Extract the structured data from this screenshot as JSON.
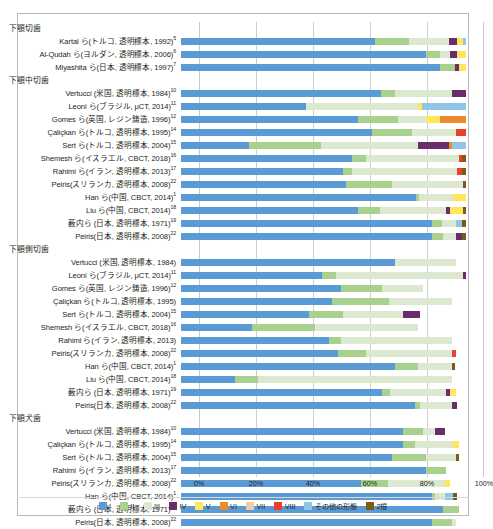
{
  "chart_data": {
    "type": "bar",
    "title": "",
    "xlabel": "",
    "ylabel": "",
    "stacked": "100%",
    "orientation": "horizontal",
    "xlim": [
      0,
      100
    ],
    "xticks": [
      "0%",
      "20%",
      "40%",
      "60%",
      "80%",
      "100%"
    ],
    "xtick_values": [
      0,
      20,
      40,
      60,
      80,
      100
    ],
    "grid": true,
    "legend_position": "bottom",
    "series": [
      {
        "name": "I",
        "color": "#5B9BD5"
      },
      {
        "name": "II",
        "color": "#A9D18E"
      },
      {
        "name": "III",
        "color": "#DCE9D0"
      },
      {
        "name": "IV",
        "color": "#6A2C6A"
      },
      {
        "name": "V",
        "color": "#FFE65A"
      },
      {
        "name": "VI",
        "color": "#ED8B2B"
      },
      {
        "name": "VII",
        "color": "#F7C9A6"
      },
      {
        "name": "VIII",
        "color": "#E8402A"
      },
      {
        "name": "その他の形態",
        "color": "#8FC6E8"
      },
      {
        "name": "2根",
        "color": "#7B5B18"
      }
    ],
    "sections": [
      {
        "header": "下顎切歯",
        "rows": [
          {
            "label": "Kartal ら(トルコ, 透明標本, 1992)",
            "ref": "5",
            "values": [
              68.0,
              12.0,
              14.0,
              3.0,
              2.0,
              0,
              0,
              0,
              1.0,
              0
            ]
          },
          {
            "label": "Al-Qudah ら(ヨルダン, 透明標本, 2006)",
            "ref": "6",
            "values": [
              86.0,
              5.0,
              3.5,
              2.5,
              3.0,
              0,
              0,
              0,
              0,
              0
            ]
          },
          {
            "label": "Miyashita ら(日本, 透明標本, 1997)",
            "ref": "7",
            "values": [
              91.0,
              5.0,
              0,
              1.5,
              2.5,
              0,
              0,
              0,
              0,
              0
            ]
          }
        ]
      },
      {
        "header": "下顎中切歯",
        "rows": [
          {
            "label": "Vertucci (米国, 透明標本, 1984)",
            "ref": "10",
            "values": [
              70.0,
              5.0,
              20.0,
              5.0,
              0,
              0,
              0,
              0,
              0,
              0
            ]
          },
          {
            "label": "Leoni ら(ブラジル, μCT, 2014)",
            "ref": "11",
            "values": [
              44.0,
              0,
              39.0,
              0,
              1.5,
              0,
              0,
              0,
              15.5,
              0
            ]
          },
          {
            "label": "Gomes ら(英国, レジン鋳造, 1996)",
            "ref": "12",
            "values": [
              62.0,
              14.0,
              10.0,
              0,
              5.0,
              9.0,
              0,
              0,
              0,
              0
            ]
          },
          {
            "label": "Çaliçkan ら(トルコ, 透明標本, 1995)",
            "ref": "14",
            "values": [
              67.0,
              14.0,
              15.5,
              0,
              0,
              0,
              0,
              3.5,
              0,
              0
            ]
          },
          {
            "label": "Sert ら(トルコ, 透明標本, 2004)",
            "ref": "15",
            "values": [
              24.0,
              25.0,
              34.0,
              11.0,
              0,
              1.0,
              0,
              0,
              5.0,
              0
            ]
          },
          {
            "label": "Shemesh ら(イスラエル, CBCT, 2018)",
            "ref": "16",
            "values": [
              60.0,
              5.0,
              32.5,
              0,
              0,
              0,
              0,
              1.0,
              0,
              1.5
            ]
          },
          {
            "label": "Rahimi ら(イラン, 透明標本, 2013)",
            "ref": "17",
            "values": [
              57.0,
              3.0,
              37.0,
              0,
              0,
              0,
              0,
              1.5,
              0,
              1.5
            ]
          },
          {
            "label": "Peiris(スリランカ, 透明標本, 2008)",
            "ref": "22",
            "values": [
              58.0,
              16.0,
              25.0,
              0,
              0,
              0,
              0,
              0,
              0,
              1.0
            ]
          },
          {
            "label": "Han ら(中国, CBCT, 2014)",
            "ref": "1",
            "values": [
              82.5,
              1.0,
              12.0,
              0,
              4.5,
              0,
              0,
              0,
              0,
              0
            ]
          },
          {
            "label": "Liu ら(中国, CBCT, 2014)",
            "ref": "18",
            "values": [
              62.0,
              8.0,
              23.0,
              1.5,
              4.5,
              0,
              0,
              0,
              0,
              1.0
            ]
          },
          {
            "label": "薮内ら (日本, 透明標本, 1971)",
            "ref": "19",
            "values": [
              88.0,
              3.5,
              5.0,
              0,
              0,
              0,
              0,
              0,
              2.0,
              1.5
            ]
          },
          {
            "label": "Peiris(日本, 透明標本, 2008)",
            "ref": "22",
            "values": [
              88.0,
              4.0,
              4.5,
              2.0,
              0,
              0,
              0,
              0,
              0,
              1.5
            ]
          }
        ]
      },
      {
        "header": "下顎側切歯",
        "rows": [
          {
            "label": "Vertucci (米国, 透明標本, 1984)",
            "ref": "",
            "values": [
              75.0,
              0,
              21.5,
              0,
              0,
              0,
              0,
              0,
              0,
              0
            ]
          },
          {
            "label": "Leoni ら(ブラジル, μCT, 2014)",
            "ref": "11",
            "values": [
              49.5,
              5.0,
              44.5,
              1.0,
              0,
              0,
              0,
              0,
              0,
              0
            ]
          },
          {
            "label": "Gomes ら(英国, レジン鋳造, 1996)",
            "ref": "12",
            "values": [
              56.0,
              14.5,
              14.5,
              0,
              0,
              0,
              0,
              0,
              0,
              0
            ]
          },
          {
            "label": "Çaliçkan ら(トルコ, 透明標本, 1995)",
            "ref": "",
            "values": [
              53.0,
              20.0,
              22.0,
              0,
              0,
              0,
              0,
              0,
              0,
              0
            ]
          },
          {
            "label": "Sert ら(トルコ, 透明標本, 2004)",
            "ref": "15",
            "values": [
              45.0,
              12.0,
              21.0,
              6.0,
              0,
              0,
              0,
              0,
              0,
              0
            ]
          },
          {
            "label": "Shemesh ら(イスラエル, CBCT, 2018)",
            "ref": "16",
            "values": [
              25.0,
              22.0,
              36.0,
              0,
              0,
              0,
              0,
              0,
              0,
              0
            ]
          },
          {
            "label": "Rahimi ら(イラン, 透明標本, 2013)",
            "ref": "",
            "values": [
              52.0,
              4.0,
              39.0,
              0,
              0,
              0,
              0,
              0,
              0,
              0
            ]
          },
          {
            "label": "Peiris(スリランカ, 透明標本, 2008)",
            "ref": "22",
            "values": [
              55.0,
              10.0,
              30.0,
              0,
              0,
              0,
              0,
              1.5,
              0,
              0
            ]
          },
          {
            "label": "Han ら(中国, CBCT, 2014)",
            "ref": "1",
            "values": [
              75.0,
              8.0,
              12.0,
              0,
              0,
              0,
              0,
              0,
              0,
              1.0
            ]
          },
          {
            "label": "Liu ら(中国, CBCT, 2014)",
            "ref": "18",
            "values": [
              19.0,
              8.0,
              68.0,
              0,
              0,
              0,
              0,
              0,
              0,
              0
            ]
          },
          {
            "label": "薮内ら (日本, 透明標本, 1971)",
            "ref": "19",
            "values": [
              70.5,
              3.0,
              19.5,
              1.5,
              2.0,
              0,
              0,
              0,
              0,
              0
            ]
          },
          {
            "label": "Peiris(日本, 透明標本, 2008)",
            "ref": "22",
            "values": [
              82.0,
              2.0,
              11.0,
              2.0,
              0,
              0,
              0,
              0,
              0,
              0
            ]
          }
        ]
      },
      {
        "header": "下顎犬歯",
        "rows": [
          {
            "label": "Vertucci (米国, 透明標本, 1984)",
            "ref": "10",
            "values": [
              78.0,
              7.0,
              4.0,
              3.5,
              0,
              0,
              0,
              0,
              0,
              0
            ]
          },
          {
            "label": "Çaliçkan ら(トルコ, 透明標本, 1995)",
            "ref": "14",
            "values": [
              78.0,
              4.0,
              13.5,
              0,
              2.0,
              0,
              0,
              0,
              0,
              0
            ]
          },
          {
            "label": "Sert ら(トルコ, 透明標本, 2004)",
            "ref": "15",
            "values": [
              74.0,
              12.0,
              10.5,
              0,
              0,
              0,
              0,
              0,
              0,
              1.0
            ]
          },
          {
            "label": "Rahimi ら(イラン, 透明標本, 2013)",
            "ref": "17",
            "values": [
              86.0,
              7.0,
              0,
              0,
              0,
              0,
              0,
              0,
              0,
              0
            ]
          },
          {
            "label": "Peiris(スリランカ, 透明標本, 2008)",
            "ref": "22",
            "values": [
              63.0,
              9.5,
              20.0,
              0,
              2.0,
              0,
              0,
              0,
              0,
              0
            ]
          },
          {
            "label": "Han ら(中国, CBCT, 2014)",
            "ref": "1",
            "values": [
              88.0,
              1.0,
              3.5,
              0,
              0,
              0,
              0,
              0,
              3.0,
              1.5
            ]
          },
          {
            "label": "薮内ら (日本, 透明標本, 1971)",
            "ref": "19",
            "values": [
              92.0,
              5.5,
              0,
              0,
              0,
              0,
              0,
              0,
              0,
              0
            ]
          },
          {
            "label": "Peiris(日本, 透明標本, 2008)",
            "ref": "22",
            "values": [
              88.0,
              7.0,
              1.5,
              0,
              0,
              0,
              0,
              0,
              0,
              0
            ]
          }
        ]
      }
    ]
  }
}
